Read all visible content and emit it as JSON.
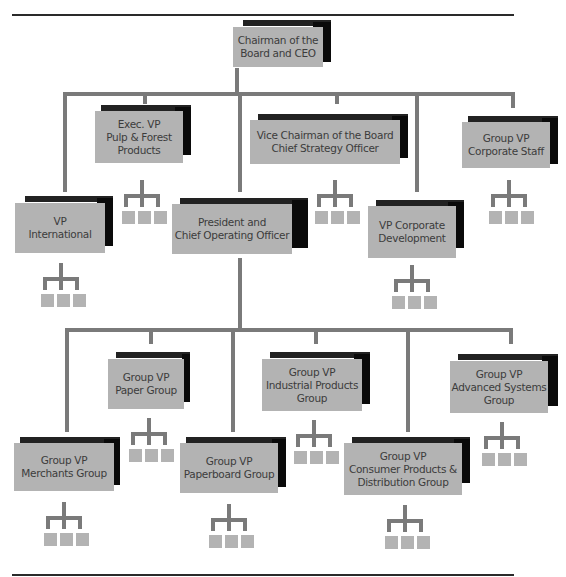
{
  "chart": {
    "root": {
      "label_line1": "Chairman of the",
      "label_line2": "Board and CEO"
    },
    "level1": [
      {
        "id": "vp-international",
        "line1": "VP",
        "line2": "International",
        "line3": ""
      },
      {
        "id": "exec-vp-pulp",
        "line1": "Exec. VP",
        "line2": "Pulp & Forest",
        "line3": "Products"
      },
      {
        "id": "president-coo",
        "line1": "President and",
        "line2": "Chief Operating Officer",
        "line3": ""
      },
      {
        "id": "vice-chairman",
        "line1": "Vice Chairman of the Board",
        "line2": "Chief Strategy Officer",
        "line3": ""
      },
      {
        "id": "vp-corp-dev",
        "line1": "VP Corporate",
        "line2": "Development",
        "line3": ""
      },
      {
        "id": "group-vp-corp-staff",
        "line1": "Group VP",
        "line2": "Corporate Staff",
        "line3": ""
      }
    ],
    "level2": [
      {
        "id": "merchants",
        "line1": "Group VP",
        "line2": "Merchants Group",
        "line3": ""
      },
      {
        "id": "paper",
        "line1": "Group VP",
        "line2": "Paper Group",
        "line3": ""
      },
      {
        "id": "paperboard",
        "line1": "Group VP",
        "line2": "Paperboard Group",
        "line3": ""
      },
      {
        "id": "industrial",
        "line1": "Group VP",
        "line2": "Industrial Products",
        "line3": "Group"
      },
      {
        "id": "consumer",
        "line1": "Group VP",
        "line2": "Consumer Products &",
        "line3": "Distribution Group"
      },
      {
        "id": "advanced",
        "line1": "Group VP",
        "line2": "Advanced Systems",
        "line3": "Group"
      }
    ],
    "colors": {
      "box_fill": "#b3b3b3",
      "connector": "#7a7a7a",
      "shadow": "#0a0a0a",
      "text": "#3c3c3c"
    }
  }
}
